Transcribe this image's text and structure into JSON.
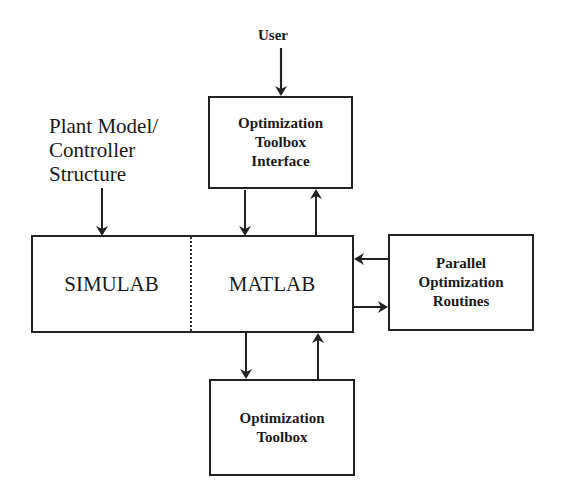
{
  "diagram": {
    "inputs": {
      "user": "User",
      "plant": "Plant Model/\nController\nStructure"
    },
    "blocks": {
      "toolbox_interface": "Optimization\nToolbox\nInterface",
      "simulab": "SIMULAB",
      "matlab": "MATLAB",
      "parallel": "Parallel\nOptimization\nRoutines",
      "toolbox": "Optimization\nToolbox"
    },
    "colors": {
      "line": "#222222",
      "background": "#ffffff"
    }
  }
}
